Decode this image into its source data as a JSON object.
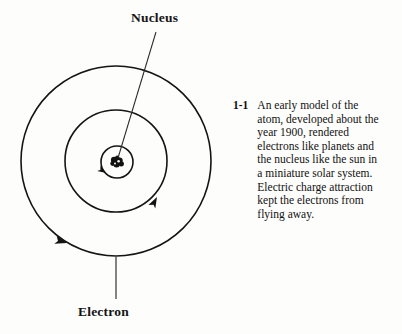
{
  "figure": {
    "background_color": "#fdfdfc",
    "ink_color": "#111111",
    "labels": {
      "nucleus": "Nucleus",
      "electron": "Electron"
    },
    "geometry": {
      "center_x": 116,
      "center_y": 161,
      "orbit_radii": [
        95,
        51,
        16
      ],
      "nucleus_dot_count": 5
    },
    "leader_lines": {
      "nucleus_from_x": 156,
      "nucleus_from_y": 32,
      "nucleus_to_x": 118,
      "nucleus_to_y": 158,
      "electron_from_x": 116,
      "electron_from_y": 298,
      "electron_to_x": 116,
      "electron_to_y": 257
    },
    "arrow_direction": "counterclockwise"
  },
  "caption": {
    "number": "1-1",
    "text": "An early model of the atom, developed about the year 1900, rendered electrons like planets and the nucleus like the sun in a miniature solar system. Electric charge attraction kept the electrons from flying away.",
    "lines": [
      "An early model of the",
      "atom, developed about the",
      "year 1900, rendered",
      "electrons like planets and",
      "the nucleus like the sun in",
      "a miniature solar system.",
      "Electric charge attraction",
      "kept the electrons from",
      "flying away."
    ]
  }
}
